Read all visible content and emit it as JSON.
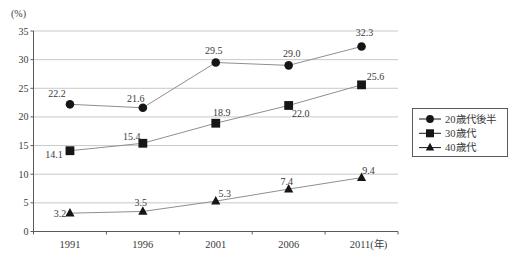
{
  "chart_data": {
    "type": "line",
    "title": "",
    "y_unit_label": "(%)",
    "x_tick_labels": [
      "1991",
      "1996",
      "2001",
      "2006",
      "2011(年)"
    ],
    "y_ticks": [
      0,
      5,
      10,
      15,
      20,
      25,
      30,
      35
    ],
    "ylim": [
      0,
      35
    ],
    "grid": true,
    "legend_position": "right",
    "series": [
      {
        "name": "20歳代後半",
        "marker": "circle",
        "values": [
          22.2,
          21.6,
          29.5,
          29.0,
          32.3
        ]
      },
      {
        "name": "30歳代",
        "marker": "square",
        "values": [
          14.1,
          15.4,
          18.9,
          22.0,
          25.6
        ]
      },
      {
        "name": "40歳代",
        "marker": "triangle",
        "values": [
          3.2,
          3.5,
          5.3,
          7.4,
          9.4
        ]
      }
    ],
    "label_offsets": [
      [
        [
          -13,
          -7
        ],
        [
          -7,
          -6
        ],
        [
          -2,
          -9
        ],
        [
          3,
          -8
        ],
        [
          3,
          -10
        ]
      ],
      [
        [
          -16,
          7
        ],
        [
          -11,
          -3
        ],
        [
          6,
          -7
        ],
        [
          12,
          12
        ],
        [
          14,
          -5
        ]
      ],
      [
        [
          -10,
          4
        ],
        [
          -2,
          -5
        ],
        [
          9,
          -4
        ],
        [
          -2,
          -4
        ],
        [
          7,
          -4
        ]
      ]
    ],
    "colors": {
      "marker": "#161616",
      "line": "#8f8f8f",
      "grid": "#c9c9c9",
      "axis": "#5a5a5a",
      "text": "#3a3a3a"
    }
  }
}
